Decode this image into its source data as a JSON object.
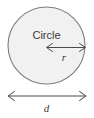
{
  "figure": {
    "width": 94,
    "height": 118,
    "background_color": "#ffffff"
  },
  "shape": {
    "name": "circle",
    "label": "Circle",
    "fill_color": "#f1f1f1",
    "stroke_color": "#7d7d7d",
    "center_x": 46.5,
    "center_y": 45.5,
    "radius": 38.5
  },
  "dimensions": [
    {
      "id": "radius",
      "label": "r",
      "meaning": "radius",
      "orientation": "horizontal",
      "arrow_style": "double-headed",
      "x1": 46.5,
      "x2": 85.5,
      "y": 47.5,
      "label_x": 63,
      "label_y": 60,
      "color": "#4a4a4a"
    },
    {
      "id": "diameter",
      "label": "d",
      "meaning": "diameter",
      "orientation": "horizontal",
      "arrow_style": "double-headed",
      "x1": 8,
      "x2": 86,
      "y": 96,
      "label_x": 46.5,
      "label_y": 111,
      "color": "#4a4a4a"
    }
  ]
}
